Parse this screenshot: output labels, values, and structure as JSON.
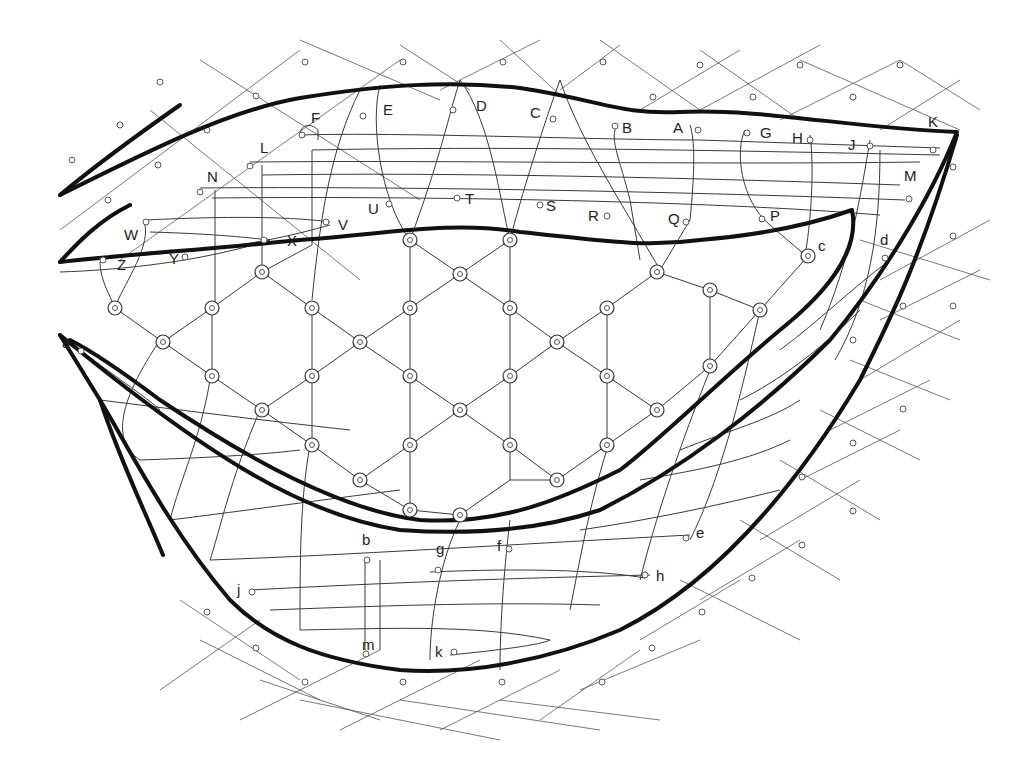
{
  "diagram": {
    "colors": {
      "outline": "#111111",
      "thread": "#3a3a3a",
      "background": "#ffffff"
    },
    "labels": [
      {
        "id": "A",
        "x": 673,
        "y": 133
      },
      {
        "id": "B",
        "x": 622,
        "y": 133
      },
      {
        "id": "C",
        "x": 530,
        "y": 118
      },
      {
        "id": "D",
        "x": 476,
        "y": 111
      },
      {
        "id": "E",
        "x": 383,
        "y": 115
      },
      {
        "id": "F",
        "x": 311,
        "y": 123
      },
      {
        "id": "G",
        "x": 760,
        "y": 138
      },
      {
        "id": "H",
        "x": 792,
        "y": 143
      },
      {
        "id": "J",
        "x": 848,
        "y": 150
      },
      {
        "id": "K",
        "x": 928,
        "y": 127
      },
      {
        "id": "L",
        "x": 260,
        "y": 153
      },
      {
        "id": "M",
        "x": 904,
        "y": 181
      },
      {
        "id": "N",
        "x": 207,
        "y": 182
      },
      {
        "id": "P",
        "x": 770,
        "y": 221
      },
      {
        "id": "Q",
        "x": 668,
        "y": 224
      },
      {
        "id": "R",
        "x": 588,
        "y": 221
      },
      {
        "id": "S",
        "x": 546,
        "y": 211
      },
      {
        "id": "T",
        "x": 465,
        "y": 204
      },
      {
        "id": "U",
        "x": 368,
        "y": 214
      },
      {
        "id": "V",
        "x": 338,
        "y": 230
      },
      {
        "id": "W",
        "x": 124,
        "y": 240
      },
      {
        "id": "X",
        "x": 287,
        "y": 246
      },
      {
        "id": "Y",
        "x": 169,
        "y": 264
      },
      {
        "id": "Z",
        "x": 117,
        "y": 270
      },
      {
        "id": "a",
        "x": 62,
        "y": 348
      },
      {
        "id": "b",
        "x": 362,
        "y": 545
      },
      {
        "id": "c",
        "x": 818,
        "y": 251
      },
      {
        "id": "d",
        "x": 880,
        "y": 245
      },
      {
        "id": "e",
        "x": 696,
        "y": 538
      },
      {
        "id": "f",
        "x": 497,
        "y": 551
      },
      {
        "id": "g",
        "x": 436,
        "y": 554
      },
      {
        "id": "h",
        "x": 656,
        "y": 581
      },
      {
        "id": "j",
        "x": 237,
        "y": 595
      },
      {
        "id": "k",
        "x": 435,
        "y": 657
      },
      {
        "id": "m",
        "x": 362,
        "y": 650
      }
    ]
  }
}
